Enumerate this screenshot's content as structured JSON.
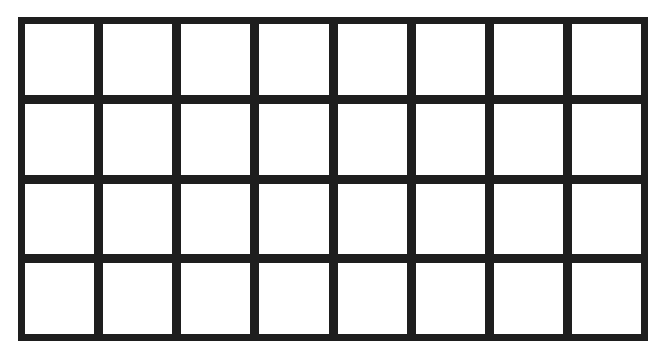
{
  "grid": {
    "rows": 4,
    "columns": 8,
    "line_color": "#1e1e1e",
    "cell_color": "#ffffff",
    "cells": [
      [
        "",
        "",
        "",
        "",
        "",
        "",
        "",
        ""
      ],
      [
        "",
        "",
        "",
        "",
        "",
        "",
        "",
        ""
      ],
      [
        "",
        "",
        "",
        "",
        "",
        "",
        "",
        ""
      ],
      [
        "",
        "",
        "",
        "",
        "",
        "",
        "",
        ""
      ]
    ]
  }
}
